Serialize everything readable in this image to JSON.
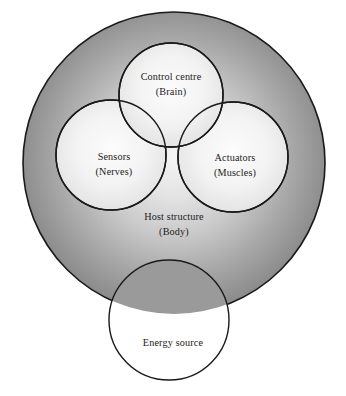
{
  "diagram": {
    "type": "venn-nested-circles",
    "colors": {
      "outline": "#1a1a1a",
      "text": "#1b1b1b",
      "page_background": "#ffffff",
      "host_fill_center": "#f2f2f2",
      "host_fill_edge": "#8c8c8c",
      "inner_fill_center": "#fbfbfb",
      "inner_fill_edge": "#e0e0e0",
      "energy_fill": "#ffffff"
    },
    "shapes": {
      "host": {
        "name": "Host structure",
        "cx": 174,
        "cy": 163,
        "r": 151,
        "shaded": true
      },
      "control_centre": {
        "name": "Control centre",
        "cx": 171,
        "cy": 95,
        "r": 52,
        "shaded": false
      },
      "sensors": {
        "name": "Sensors",
        "cx": 111,
        "cy": 155,
        "r": 55,
        "shaded": false
      },
      "actuators": {
        "name": "Actuators",
        "cx": 233,
        "cy": 157,
        "r": 55,
        "shaded": false
      },
      "energy_source": {
        "name": "Energy source",
        "cx": 169,
        "cy": 320,
        "r": 60,
        "shaded": false
      }
    },
    "labels": {
      "control_centre": {
        "line1": "Control centre",
        "line2": "(Brain)",
        "x": 171,
        "y1": 78,
        "y2": 93
      },
      "sensors": {
        "line1": "Sensors",
        "line2": "(Nerves)",
        "x": 114,
        "y1": 158,
        "y2": 173
      },
      "actuators": {
        "line1": "Actuators",
        "line2": "(Muscles)",
        "x": 235,
        "y1": 159,
        "y2": 174
      },
      "host_structure": {
        "line1": "Host structure",
        "line2": "(Body)",
        "x": 174,
        "y1": 218,
        "y2": 233
      },
      "energy_source": {
        "line1": "Energy source",
        "x": 173,
        "y1": 344
      }
    }
  }
}
